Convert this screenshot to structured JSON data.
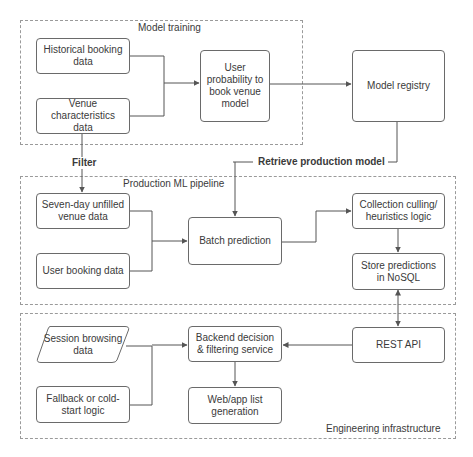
{
  "groups": {
    "training": {
      "label": "Model training"
    },
    "production": {
      "label": "Production ML pipeline"
    },
    "engineering": {
      "label": "Engineering infrastructure"
    }
  },
  "nodes": {
    "historical_booking": "Historical booking data",
    "venue_characteristics": "Venue characteristics data",
    "user_probability_model": "User probability to book venue model",
    "model_registry": "Model registry",
    "seven_day_unfilled": "Seven-day unfilled venue data",
    "user_booking": "User booking data",
    "batch_prediction": "Batch prediction",
    "collection_culling": "Collection culling/ heuristics logic",
    "store_predictions": "Store predictions in NoSQL",
    "session_browsing": "Session browsing data",
    "fallback_cold_start": "Fallback or cold-start logic",
    "backend_decision": "Backend decision & filtering service",
    "web_app_list": "Web/app list generation",
    "rest_api": "REST API"
  },
  "edge_labels": {
    "filter": "Filter",
    "retrieve": "Retrieve production model"
  },
  "edges": [
    {
      "from": "historical_booking",
      "to": "user_probability_model"
    },
    {
      "from": "venue_characteristics",
      "to": "user_probability_model"
    },
    {
      "from": "user_probability_model",
      "to": "model_registry"
    },
    {
      "from": "venue_characteristics",
      "to": "seven_day_unfilled",
      "label": "Filter"
    },
    {
      "from": "model_registry",
      "to": "batch_prediction",
      "label": "Retrieve production model"
    },
    {
      "from": "seven_day_unfilled",
      "to": "batch_prediction"
    },
    {
      "from": "user_booking",
      "to": "batch_prediction"
    },
    {
      "from": "batch_prediction",
      "to": "collection_culling"
    },
    {
      "from": "collection_culling",
      "to": "store_predictions"
    },
    {
      "from": "store_predictions",
      "to": "rest_api",
      "bidirectional": true
    },
    {
      "from": "rest_api",
      "to": "backend_decision"
    },
    {
      "from": "session_browsing",
      "to": "backend_decision"
    },
    {
      "from": "fallback_cold_start",
      "to": "backend_decision"
    },
    {
      "from": "backend_decision",
      "to": "web_app_list"
    }
  ],
  "colors": {
    "line": "#555555",
    "border": "#6a6a6a",
    "dashed": "#9a9a9a",
    "text": "#3a3a3a"
  }
}
